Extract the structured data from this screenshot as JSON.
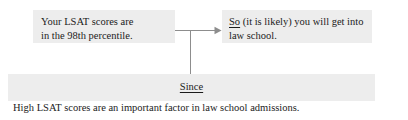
{
  "diagram": {
    "type": "toulmin-argument-diagram",
    "premise": {
      "text": "Your LSAT scores are\nin the 98th percentile."
    },
    "conclusion": {
      "connective": "So",
      "text": " (it is likely) you will get into\nlaw school."
    },
    "warrant": {
      "connective": "Since",
      "statement": "High LSAT scores are an important factor in law school admissions."
    },
    "connector": {
      "arrow_direction": "right",
      "line_color": "#8d8d8d"
    },
    "colors": {
      "box_fill": "#ededed",
      "text": "#1b1b1b",
      "background": "#ffffff"
    }
  }
}
